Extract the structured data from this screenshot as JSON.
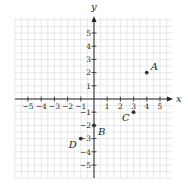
{
  "chart_data": {
    "type": "scatter",
    "title": "",
    "xlabel": "x",
    "ylabel": "y",
    "xlim": [
      -6,
      6
    ],
    "ylim": [
      -6,
      6
    ],
    "grid": true,
    "x_ticks": [
      -5,
      -4,
      -3,
      -2,
      -1,
      1,
      2,
      3,
      4,
      5
    ],
    "y_ticks": [
      -5,
      -4,
      -3,
      -2,
      -1,
      1,
      2,
      3,
      4,
      5
    ],
    "x_tick_labels": [
      "−5",
      "−4",
      "−3",
      "−2",
      "−1",
      "1",
      "2",
      "3",
      "4",
      "5"
    ],
    "y_tick_labels": [
      "−5",
      "−4",
      "−3",
      "−2",
      "−1",
      "1",
      "2",
      "3",
      "4",
      "5"
    ],
    "points": [
      {
        "label": "A",
        "x": 4,
        "y": 2
      },
      {
        "label": "B",
        "x": 0,
        "y": -2
      },
      {
        "label": "C",
        "x": 3,
        "y": -1
      },
      {
        "label": "D",
        "x": -1,
        "y": -3
      }
    ]
  },
  "colors": {
    "grid": "#d9d9d9",
    "axis": "#222222",
    "point": "#333333",
    "text": "#222222"
  }
}
